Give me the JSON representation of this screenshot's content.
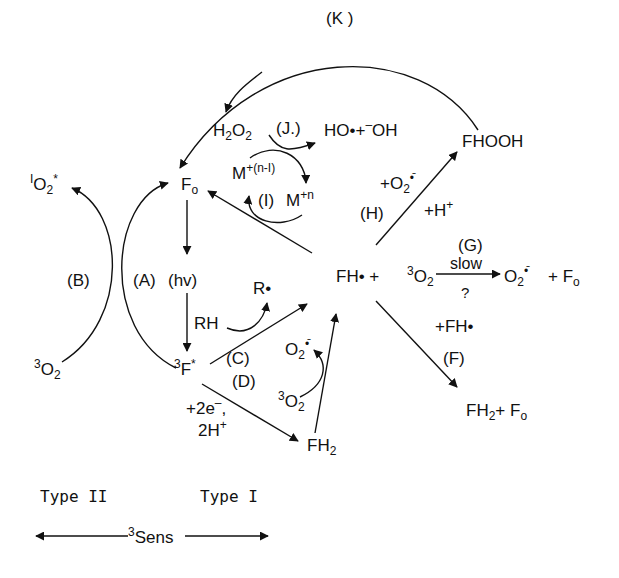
{
  "diagram": {
    "colors": {
      "ink": "#111111",
      "background": "#ffffff"
    },
    "species": {
      "F0": {
        "main": "F",
        "sub": "o"
      },
      "F3star": {
        "sup": "3",
        "main": "F",
        "post": "*"
      },
      "FHdot": {
        "main": "FH•"
      },
      "FH2": {
        "main": "FH",
        "sub": "2"
      },
      "FHOOH": {
        "main": "FHOOH"
      },
      "H2O2": {
        "a": "H",
        "s1": "2",
        "b": "O",
        "s2": "2"
      },
      "HO_products": {
        "text": "HO•+",
        "sup": "–",
        "tail": "OH"
      },
      "M_reduced": {
        "main": "M",
        "sup": "+(n-I)"
      },
      "M_oxidized": {
        "main": "M",
        "sup": "+n"
      },
      "singlet_O2": {
        "sup": "I",
        "main": "O",
        "sub": "2",
        "post": "*"
      },
      "triplet_O2_left": {
        "sup": "3",
        "main": "O",
        "sub": "2"
      },
      "triplet_O2_mid": {
        "sup": "3",
        "main": "O",
        "sub": "2"
      },
      "triplet_O2_right": {
        "sup": "3",
        "main": "O",
        "sub": "2"
      },
      "superoxide_mid": {
        "main": "O",
        "sub": "2",
        "sup": "•̄"
      },
      "superoxide_right": {
        "main": "O",
        "sub": "2",
        "sup": "•̄"
      },
      "R_radical": {
        "main": "R•"
      },
      "RH": {
        "main": "RH"
      }
    },
    "equation_G": {
      "left": "FH•  +",
      "right_plus": "+ F",
      "right_sub": "o"
    },
    "equation_F": {
      "plus": "+FH•",
      "product": "FH",
      "sub": "2",
      "tail": "+ F",
      "tail_sub": "o"
    },
    "reagents": {
      "H": {
        "top": "+O",
        "top_sub": "2",
        "top_sup": "•̄",
        "bottom": "+H",
        "bottom_sup": "+"
      },
      "D": {
        "line1": "+2e",
        "line1_sup": "–",
        "line1_tail": ",",
        "line2": "2H",
        "line2_sup": "+"
      },
      "G": {
        "above": "slow",
        "below": "?"
      },
      "A": {
        "extra": "(hv)"
      }
    },
    "step_labels": {
      "A": "(A)",
      "B": "(B)",
      "C": "(C)",
      "D": "(D)",
      "F": "(F)",
      "G": "(G)",
      "H": "(H)",
      "I": "(I)",
      "J": "(J.)",
      "K": "(K )"
    },
    "legend": {
      "type_ii": "Type II",
      "type_i": "Type I",
      "sens_sup": "3",
      "sens": "Sens"
    }
  }
}
